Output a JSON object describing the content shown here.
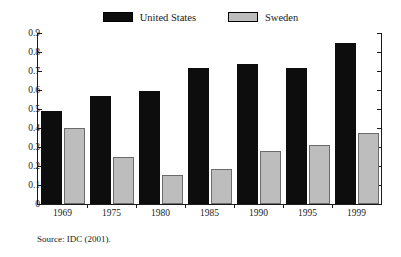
{
  "figure": {
    "top_cut_text": "",
    "source_note": "Source: IDC (2001)."
  },
  "legend": {
    "items": [
      {
        "label": "United States",
        "color": "#0d0d0d",
        "swatch_name": "legend-swatch-united-states"
      },
      {
        "label": "Sweden",
        "color": "#bdbdbd",
        "swatch_name": "legend-swatch-sweden"
      }
    ]
  },
  "axes": {
    "y_tick_labels": [
      "0.9",
      "0.8",
      "0.7",
      "0.6",
      "0.5",
      "0.4",
      "0.3",
      "0.2",
      "0.1",
      "0"
    ],
    "y_min": 0,
    "y_max": 0.9,
    "y_step": 0.1
  },
  "chart_data": {
    "type": "bar",
    "title": "",
    "subtitle": "",
    "xlabel": "",
    "ylabel": "",
    "categories": [
      "1969",
      "1975",
      "1980",
      "1985",
      "1990",
      "1995",
      "1999"
    ],
    "series": [
      {
        "name": "United States",
        "color": "#0d0d0d",
        "values": [
          0.49,
          0.57,
          0.595,
          0.715,
          0.735,
          0.715,
          0.845
        ]
      },
      {
        "name": "Sweden",
        "color": "#bdbdbd",
        "values": [
          0.4,
          0.245,
          0.155,
          0.185,
          0.28,
          0.31,
          0.375
        ]
      }
    ],
    "ylim": [
      0,
      0.9
    ],
    "ytick_labels": [
      "0",
      "0.1",
      "0.2",
      "0.3",
      "0.4",
      "0.5",
      "0.6",
      "0.7",
      "0.8",
      "0.9"
    ],
    "grid": false,
    "legend_position": "top-center",
    "annotations": [
      "Source: IDC (2001)."
    ]
  }
}
